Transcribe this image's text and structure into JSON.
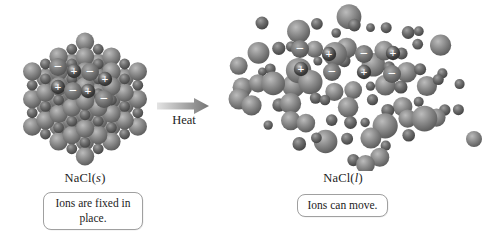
{
  "solid": {
    "formula_prefix": "NaCl(",
    "state": "s",
    "formula_suffix": ")",
    "caption": "Ions are fixed in place.",
    "ions": [
      {
        "sign": "−",
        "x": 50,
        "y": 52
      },
      {
        "sign": "+",
        "x": 66,
        "y": 56
      },
      {
        "sign": "−",
        "x": 82,
        "y": 57
      },
      {
        "sign": "+",
        "x": 97,
        "y": 64
      },
      {
        "sign": "+",
        "x": 50,
        "y": 72
      },
      {
        "sign": "−",
        "x": 65,
        "y": 76
      },
      {
        "sign": "+",
        "x": 80,
        "y": 76
      },
      {
        "sign": "−",
        "x": 96,
        "y": 84
      }
    ]
  },
  "arrow": {
    "label": "Heat"
  },
  "liquid": {
    "formula_prefix": "NaCl(",
    "state": "l",
    "formula_suffix": ")",
    "caption": "Ions can move.",
    "ions": [
      {
        "sign": "−",
        "x": 75,
        "y": 46
      },
      {
        "sign": "+",
        "x": 104,
        "y": 51
      },
      {
        "sign": "−",
        "x": 139,
        "y": 51
      },
      {
        "sign": "+",
        "x": 168,
        "y": 50
      },
      {
        "sign": "+",
        "x": 76,
        "y": 66
      },
      {
        "sign": "−",
        "x": 107,
        "y": 69
      },
      {
        "sign": "+",
        "x": 139,
        "y": 69
      },
      {
        "sign": "−",
        "x": 167,
        "y": 71
      }
    ]
  },
  "colors": {
    "background": "#ffffff",
    "sphere_large": "#8d8d8d",
    "sphere_large_hi": "#bcbcbc",
    "sphere_large_lo": "#565656",
    "sphere_small": "#6d6d6d",
    "sphere_small_hi": "#a0a0a0",
    "sphere_small_lo": "#3e3e3e",
    "ion_plus": "#3c3c3c",
    "ion_plus_hi": "#cfcfcf",
    "ion_minus": "#787878",
    "ion_minus_hi": "#aaaaaa",
    "ion_sign": "#ffffff",
    "arrow_start": "#e4e4e4",
    "arrow_end": "#747474",
    "callout_border": "#a0a0a0",
    "text": "#1c1c1c"
  }
}
